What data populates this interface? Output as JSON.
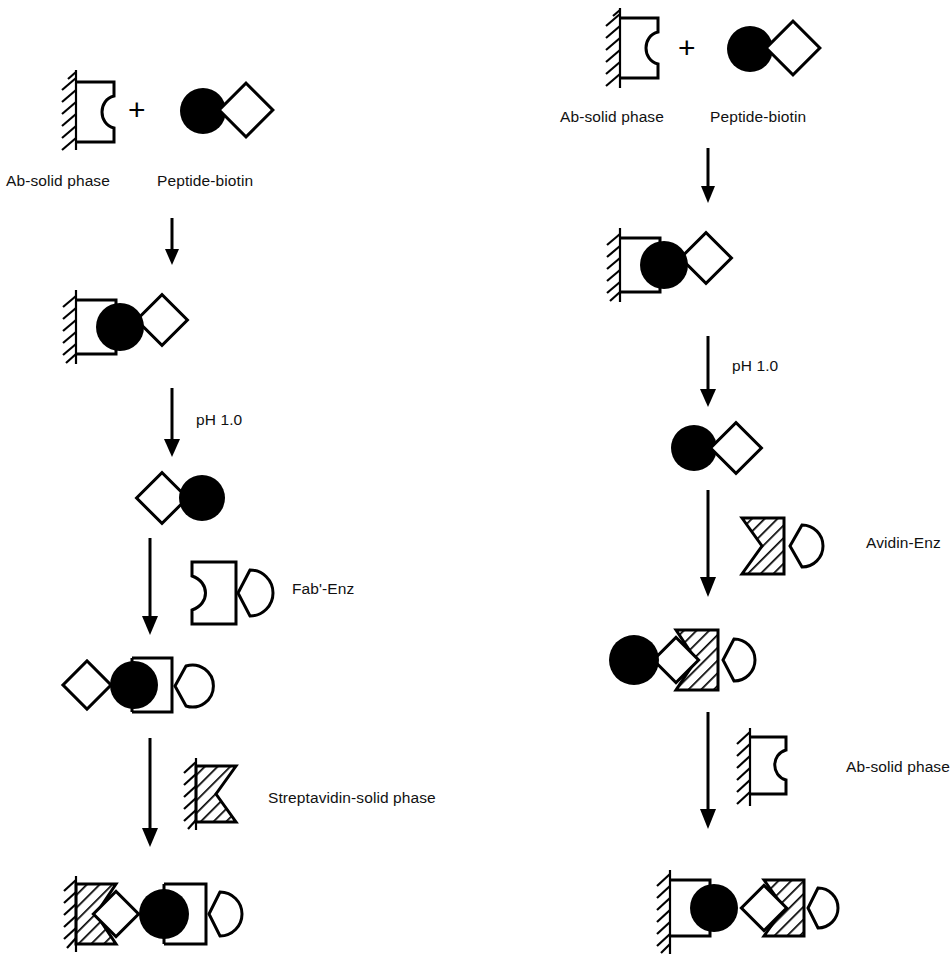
{
  "figure": {
    "type": "scientific-scheme",
    "background_color": "#ffffff",
    "ink_color": "#000000"
  },
  "legend_symbols": [
    {
      "key": "ab-solid-phase",
      "name": "Ab-solid phase",
      "depiction": "hatched wall with notched antibody rectangle"
    },
    {
      "key": "peptide-biotin",
      "name": "Peptide-biotin",
      "depiction": "filled black circle joined to open diamond"
    },
    {
      "key": "fab-enz",
      "name": "Fab'-Enz",
      "depiction": "notched rectangle with pac-man enzyme"
    },
    {
      "key": "streptavidin-solid-phase",
      "name": "Streptavidin-solid phase",
      "depiction": "hatched wall with hatched notched block"
    },
    {
      "key": "avidin-enz",
      "name": "Avidin-Enz",
      "depiction": "hatched notched block with pac-man enzyme"
    },
    {
      "key": "ph-elution",
      "name": "pH 1.0",
      "depiction": "elution condition label on arrow"
    }
  ],
  "left_column": {
    "id": "scheme-left",
    "steps": [
      {
        "index": 0,
        "kind": "reactants",
        "operator": "+",
        "items": [
          "ab-solid-phase",
          "peptide-biotin"
        ],
        "labels": [
          "Ab-solid phase",
          "Peptide-biotin"
        ]
      },
      {
        "index": 1,
        "kind": "arrow",
        "label": ""
      },
      {
        "index": 2,
        "kind": "complex",
        "items": [
          "ab-solid-phase",
          "peptide-biotin"
        ],
        "labels": []
      },
      {
        "index": 3,
        "kind": "arrow",
        "label": "pH 1.0"
      },
      {
        "index": 4,
        "kind": "complex",
        "items": [
          "biotin-diamond",
          "peptide-circle"
        ],
        "labels": []
      },
      {
        "index": 5,
        "kind": "arrow",
        "label": "Fab'-Enz",
        "reagent": "fab-enz"
      },
      {
        "index": 6,
        "kind": "complex",
        "items": [
          "biotin-diamond",
          "peptide-circle",
          "fab-enz"
        ],
        "labels": []
      },
      {
        "index": 7,
        "kind": "arrow",
        "label": "Streptavidin-solid phase",
        "reagent": "streptavidin-solid-phase"
      },
      {
        "index": 8,
        "kind": "complex",
        "items": [
          "streptavidin-solid-phase",
          "biotin-diamond",
          "peptide-circle",
          "fab-enz"
        ],
        "labels": []
      }
    ]
  },
  "right_column": {
    "id": "scheme-right",
    "steps": [
      {
        "index": 0,
        "kind": "reactants",
        "operator": "+",
        "items": [
          "ab-solid-phase",
          "peptide-biotin"
        ],
        "labels": [
          "Ab-solid phase",
          "Peptide-biotin"
        ]
      },
      {
        "index": 1,
        "kind": "arrow",
        "label": ""
      },
      {
        "index": 2,
        "kind": "complex",
        "items": [
          "ab-solid-phase",
          "peptide-biotin"
        ],
        "labels": []
      },
      {
        "index": 3,
        "kind": "arrow",
        "label": "pH 1.0"
      },
      {
        "index": 4,
        "kind": "complex",
        "items": [
          "peptide-circle",
          "biotin-diamond"
        ],
        "labels": []
      },
      {
        "index": 5,
        "kind": "arrow",
        "label": "Avidin-Enz",
        "reagent": "avidin-enz"
      },
      {
        "index": 6,
        "kind": "complex",
        "items": [
          "peptide-circle",
          "biotin-diamond",
          "avidin-enz"
        ],
        "labels": []
      },
      {
        "index": 7,
        "kind": "arrow",
        "label": "Ab-solid phase",
        "reagent": "ab-solid-phase"
      },
      {
        "index": 8,
        "kind": "complex",
        "items": [
          "ab-solid-phase",
          "peptide-circle",
          "biotin-diamond",
          "avidin-enz"
        ],
        "labels": []
      }
    ]
  },
  "text": {
    "ab_solid_phase": "Ab-solid phase",
    "peptide_biotin": "Peptide-biotin",
    "ph_1_0": "pH 1.0",
    "fab_enz": "Fab'-Enz",
    "streptavidin_solid_phase": "Streptavidin-solid phase",
    "avidin_enz": "Avidin-Enz",
    "plus": "+"
  }
}
